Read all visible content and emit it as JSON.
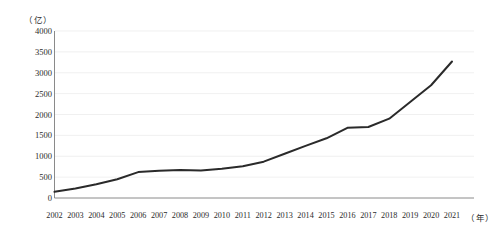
{
  "chart_data": {
    "type": "line",
    "title": "",
    "xlabel": "（年）",
    "ylabel": "（亿）",
    "y_unit_label": "（亿）",
    "x_unit_label": "（年）",
    "categories": [
      "2002",
      "2003",
      "2004",
      "2005",
      "2006",
      "2007",
      "2008",
      "2009",
      "2010",
      "2011",
      "2012",
      "2013",
      "2014",
      "2015",
      "2016",
      "2017",
      "2018",
      "2019",
      "2020",
      "2021"
    ],
    "values": [
      150,
      230,
      330,
      450,
      620,
      650,
      670,
      660,
      700,
      760,
      870,
      1060,
      1250,
      1430,
      1680,
      1700,
      1900,
      2300,
      2700,
      3270
    ],
    "ylim": [
      0,
      4000
    ],
    "yticks": [
      0,
      500,
      1000,
      1500,
      2000,
      2500,
      3000,
      3500,
      4000
    ],
    "ytick_labels": [
      "0",
      "500",
      "1000",
      "1500",
      "2000",
      "2500",
      "3000",
      "3500",
      "4000"
    ],
    "grid": true,
    "legend": false,
    "series": [
      {
        "name": "series-1",
        "color": "#2a2a2a",
        "values": [
          150,
          230,
          330,
          450,
          620,
          650,
          670,
          660,
          700,
          760,
          870,
          1060,
          1250,
          1430,
          1680,
          1700,
          1900,
          2300,
          2700,
          3270
        ]
      }
    ],
    "colors": {
      "line": "#2a2a2a",
      "axis": "#8a8a8a",
      "grid": "#e9e9e9",
      "text": "#2b2b2b",
      "background": "#ffffff"
    }
  }
}
